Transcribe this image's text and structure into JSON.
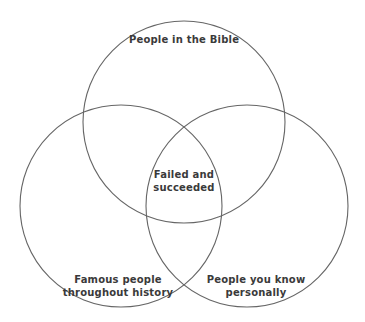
{
  "diagram": {
    "type": "venn",
    "stroke_color": "#666666",
    "text_color": "#3a3a3a",
    "circles": [
      {
        "id": "top",
        "cx": 184,
        "cy": 122,
        "r": 101,
        "label": "People in the Bible"
      },
      {
        "id": "left",
        "cx": 121,
        "cy": 206,
        "r": 101,
        "label_line1": "Famous people",
        "label_line2": "throughout history"
      },
      {
        "id": "right",
        "cx": 247,
        "cy": 206,
        "r": 101,
        "label_line1": "People you know",
        "label_line2": "personally"
      }
    ],
    "center": {
      "label_line1": "Failed and",
      "label_line2": "succeeded"
    }
  }
}
